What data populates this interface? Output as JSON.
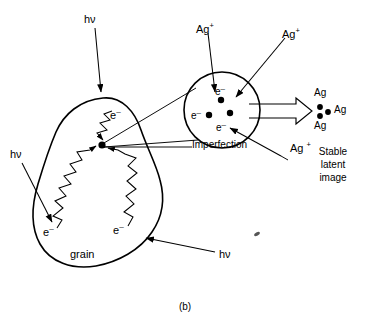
{
  "figure": {
    "caption": "(b)",
    "title_description": "Formation of a stable latent image in a photographic silver halide grain"
  },
  "labels": {
    "hv_top": "hν",
    "hv_left": "hν",
    "hv_bottom": "hν",
    "grain": "grain",
    "imperfection": "Imperfection",
    "electron_grain_top": "e",
    "electron_grain_left": "e",
    "electron_grain_bottom": "e",
    "electron_circle_top": "e",
    "electron_circle_left": "e",
    "electron_circle_bottom": "e",
    "electron_superscript": "–",
    "silver_ion_left": "Ag",
    "silver_ion_right": "Ag",
    "silver_ion_bottom": "Ag",
    "silver_ion_superscript": "+",
    "ag_cluster_top": "Ag",
    "ag_cluster_middle": "Ag",
    "ag_cluster_bottom": "Ag",
    "stable_line1": "Stable",
    "stable_line2": "latent",
    "stable_line3": "image"
  },
  "colors": {
    "ink": "#000000",
    "background": "#ffffff"
  },
  "geometry": {
    "canvas_width": 370,
    "canvas_height": 329,
    "magnified_circle_center_x": 222,
    "magnified_circle_center_y": 110,
    "magnified_circle_radius": 38,
    "imperfection_dot_x": 102,
    "imperfection_dot_y": 145
  }
}
